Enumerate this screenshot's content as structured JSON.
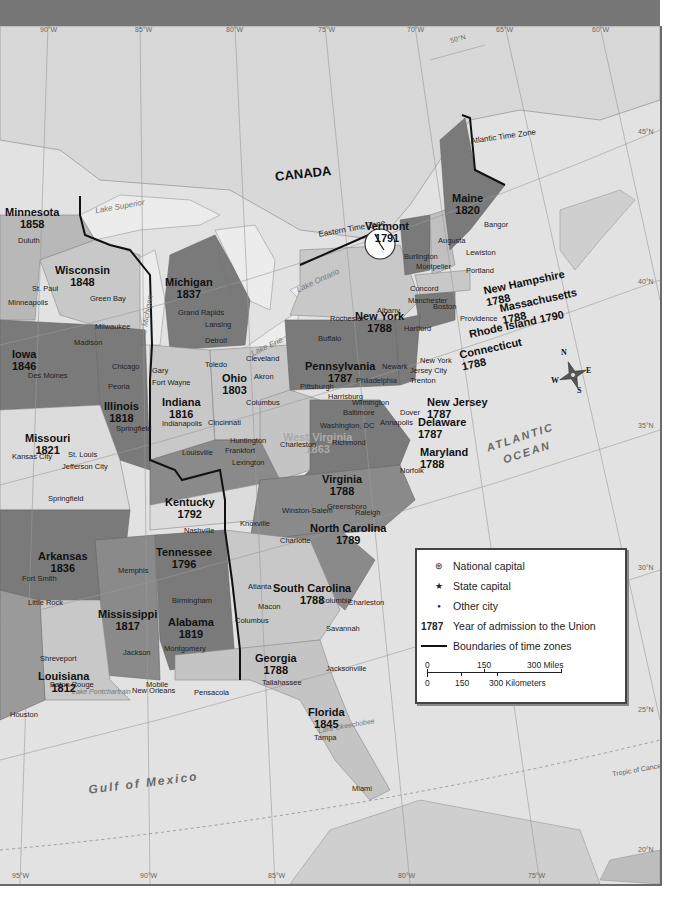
{
  "map": {
    "country_label": "CANADA",
    "time_zones": [
      "Eastern Time Zone",
      "Atlantic Time Zone"
    ],
    "water_bodies": [
      "Gulf of Mexico",
      "ATLANTIC",
      "OCEAN"
    ],
    "lakes": [
      "Lake Superior",
      "Lake Michigan",
      "Lake Huron",
      "Lake Ontario",
      "Lake Erie",
      "Lake Pontchartrain",
      "Lake Okeechobee"
    ],
    "compass": {
      "n": "N",
      "e": "E",
      "s": "S",
      "w": "W"
    },
    "longitude_top": [
      "90°W",
      "85°W",
      "80°W",
      "75°W",
      "70°W",
      "65°W",
      "60°W"
    ],
    "longitude_bottom": [
      "95°W",
      "90°W",
      "85°W",
      "80°W",
      "75°W"
    ],
    "latitude_right": [
      "45°N",
      "40°N",
      "35°N",
      "30°N",
      "25°N",
      "20°N"
    ],
    "lat_50": "50°N",
    "tropic": "Tropic of Cancer",
    "states": [
      {
        "name": "Minnesota",
        "year": "1858"
      },
      {
        "name": "Wisconsin",
        "year": "1848"
      },
      {
        "name": "Michigan",
        "year": "1837"
      },
      {
        "name": "Iowa",
        "year": "1846"
      },
      {
        "name": "Illinois",
        "year": "1818"
      },
      {
        "name": "Indiana",
        "year": "1816"
      },
      {
        "name": "Ohio",
        "year": "1803"
      },
      {
        "name": "Missouri",
        "year": "1821"
      },
      {
        "name": "Kentucky",
        "year": "1792"
      },
      {
        "name": "West Virginia",
        "year": "1863"
      },
      {
        "name": "Virginia",
        "year": "1788"
      },
      {
        "name": "Pennsylvania",
        "year": "1787"
      },
      {
        "name": "New York",
        "year": "1788"
      },
      {
        "name": "Vermont",
        "year": "1791"
      },
      {
        "name": "Maine",
        "year": "1820"
      },
      {
        "name": "New Hampshire",
        "year": "1788"
      },
      {
        "name": "Massachusetts",
        "year": "1788"
      },
      {
        "name": "Rhode Island 1790",
        "year": ""
      },
      {
        "name": "Connecticut",
        "year": "1788"
      },
      {
        "name": "New Jersey",
        "year": "1787"
      },
      {
        "name": "Delaware",
        "year": "1787"
      },
      {
        "name": "Maryland",
        "year": "1788"
      },
      {
        "name": "Tennessee",
        "year": "1796"
      },
      {
        "name": "North Carolina",
        "year": "1789"
      },
      {
        "name": "South Carolina",
        "year": "1788"
      },
      {
        "name": "Arkansas",
        "year": "1836"
      },
      {
        "name": "Mississippi",
        "year": "1817"
      },
      {
        "name": "Alabama",
        "year": "1819"
      },
      {
        "name": "Georgia",
        "year": "1788"
      },
      {
        "name": "Louisiana",
        "year": "1812"
      },
      {
        "name": "Florida",
        "year": "1845"
      }
    ],
    "cities": {
      "state_capitals": [
        "St. Paul",
        "Madison",
        "Lansing",
        "Des Moines",
        "Springfield",
        "Indianapolis",
        "Columbus",
        "Jefferson City",
        "Frankfort",
        "Charleston",
        "Richmond",
        "Harrisburg",
        "Albany",
        "Montpelier",
        "Augusta",
        "Concord",
        "Boston",
        "Providence",
        "Hartford",
        "Trenton",
        "Dover",
        "Annapolis",
        "Nashville",
        "Raleigh",
        "Columbia",
        "Little Rock",
        "Jackson",
        "Montgomery",
        "Atlanta",
        "Baton Rouge",
        "Tallahassee"
      ],
      "national_capital": "Washington, DC",
      "other": [
        "Duluth",
        "Minneapolis",
        "Green Bay",
        "Milwaukee",
        "Grand Rapids",
        "Detroit",
        "Chicago",
        "Gary",
        "Fort Wayne",
        "Peoria",
        "Toledo",
        "Cleveland",
        "Akron",
        "Cincinnati",
        "Louisville",
        "St. Louis",
        "Kansas City",
        "Springfield",
        "Huntington",
        "Lexington",
        "Pittsburgh",
        "Philadelphia",
        "Wilmington",
        "Baltimore",
        "Newark",
        "New York",
        "Jersey City",
        "Buffalo",
        "Rochester",
        "Burlington",
        "Manchester",
        "Bangor",
        "Lewiston",
        "Portland",
        "Norfolk",
        "Knoxville",
        "Winston-Salem",
        "Greensboro",
        "Charlotte",
        "Memphis",
        "Fort Smith",
        "Shreveport",
        "Birmingham",
        "Macon",
        "Columbus",
        "Charleston",
        "Savannah",
        "Mobile",
        "Pensacola",
        "New Orleans",
        "Jacksonville",
        "Tampa",
        "Miami",
        "Houston"
      ]
    }
  },
  "legend": {
    "items": [
      {
        "symbol": "⊛",
        "label": "National capital"
      },
      {
        "symbol": "★",
        "label": "State capital"
      },
      {
        "symbol": "●",
        "label": "Other city"
      },
      {
        "symbol": "1787",
        "label": "Year of admission to the Union"
      },
      {
        "symbol": "line",
        "label": "Boundaries of time zones"
      }
    ],
    "scale": {
      "miles": [
        "0",
        "150",
        "300 Miles"
      ],
      "km": [
        "0",
        "150",
        "300 Kilometers"
      ]
    }
  }
}
